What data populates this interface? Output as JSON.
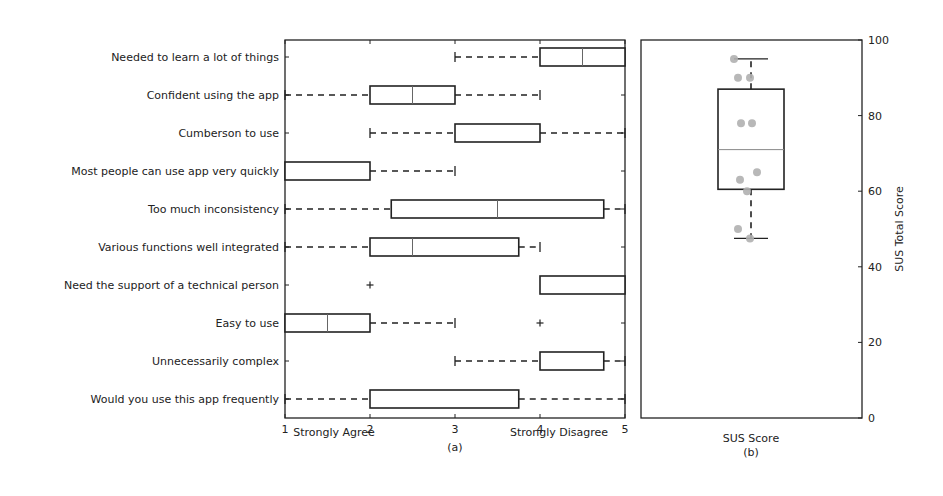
{
  "chart_data": [
    {
      "type": "boxplot",
      "orientation": "horizontal",
      "panel_label": "(a)",
      "title": "",
      "xlabel_left": "Strongly Agree",
      "xlabel_right": "Strongly Disagree",
      "xlim": [
        1,
        5
      ],
      "xticks": [
        "1",
        "2",
        "3",
        "4",
        "5"
      ],
      "categories": [
        "Needed to learn a lot of things",
        "Confident using the app",
        "Cumberson to use",
        "Most people can use app very quickly",
        "Too much inconsistency",
        "Various functions well integrated",
        "Need the support of a technical person",
        "Easy to use",
        "Unnecessarily complex",
        "Would you use this app frequently"
      ],
      "boxes": [
        {
          "whisker_low": 3,
          "q1": 4,
          "median": 4.5,
          "q3": 5,
          "whisker_high": 5,
          "outliers": []
        },
        {
          "whisker_low": 1,
          "q1": 2,
          "median": 2.5,
          "q3": 3,
          "whisker_high": 4,
          "outliers": []
        },
        {
          "whisker_low": 2,
          "q1": 3,
          "median": 3,
          "q3": 4,
          "whisker_high": 5,
          "outliers": []
        },
        {
          "whisker_low": 1,
          "q1": 1,
          "median": 1,
          "q3": 2,
          "whisker_high": 3,
          "outliers": []
        },
        {
          "whisker_low": 1,
          "q1": 2.25,
          "median": 3.5,
          "q3": 4.75,
          "whisker_high": 5,
          "outliers": []
        },
        {
          "whisker_low": 1,
          "q1": 2,
          "median": 2.5,
          "q3": 3.75,
          "whisker_high": 4,
          "outliers": []
        },
        {
          "whisker_low": 4,
          "q1": 4,
          "median": 4,
          "q3": 5,
          "whisker_high": 5,
          "outliers": [
            2
          ]
        },
        {
          "whisker_low": 1,
          "q1": 1,
          "median": 1.5,
          "q3": 2,
          "whisker_high": 3,
          "outliers": [
            4
          ]
        },
        {
          "whisker_low": 3,
          "q1": 4,
          "median": 4,
          "q3": 4.75,
          "whisker_high": 5,
          "outliers": []
        },
        {
          "whisker_low": 1,
          "q1": 2,
          "median": 2,
          "q3": 3.75,
          "whisker_high": 5,
          "outliers": []
        }
      ],
      "grid": false,
      "legend": null
    },
    {
      "type": "boxplot",
      "orientation": "vertical",
      "panel_label": "(b)",
      "xlabel": "SUS Score",
      "ylabel": "SUS Total Score",
      "ylim": [
        0,
        100
      ],
      "yticks": [
        "0",
        "20",
        "40",
        "60",
        "80",
        "100"
      ],
      "box": {
        "whisker_low": 47.5,
        "q1": 60.5,
        "median": 71,
        "q3": 87,
        "whisker_high": 95
      },
      "points": [
        95,
        90,
        90,
        78,
        78,
        65,
        63,
        60,
        50,
        47.5
      ],
      "point_color": "#b0b0b0",
      "grid": false,
      "legend": null
    }
  ],
  "panel_a": {
    "xlabel_left": "Strongly Agree",
    "xlabel_right": "Strongly Disagree",
    "caption": "(a)"
  },
  "panel_b": {
    "xlabel": "SUS Score",
    "ylabel": "SUS Total Score",
    "caption": "(b)"
  }
}
